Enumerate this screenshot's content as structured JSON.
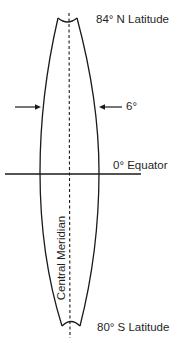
{
  "diagram": {
    "labels": {
      "north_limit": "84° N Latitude",
      "zone_width": "6°",
      "equator": "0° Equator",
      "south_limit": "80° S Latitude",
      "central_meridian": "Central Meridian"
    },
    "colors": {
      "line": "#1a1a1a",
      "background": "#ffffff"
    }
  }
}
